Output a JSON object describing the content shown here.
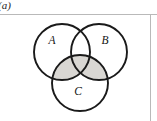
{
  "figure": {
    "caption": "(a)",
    "set_labels": {
      "a": "A",
      "b": "B",
      "c": "C"
    }
  },
  "chart_data": {
    "type": "diagram",
    "diagram_kind": "venn",
    "title": "(a)",
    "sets": [
      "A",
      "B",
      "C"
    ],
    "circles": [
      {
        "name": "A",
        "label": "A",
        "cx": 62,
        "cy": 52,
        "r": 28,
        "label_x": 52,
        "label_y": 44
      },
      {
        "name": "B",
        "label": "B",
        "cx": 99,
        "cy": 52,
        "r": 28,
        "label_x": 105,
        "label_y": 44
      },
      {
        "name": "C",
        "label": "C",
        "cx": 80,
        "cy": 83,
        "r": 28,
        "label_x": 78,
        "label_y": 95
      }
    ],
    "shaded_regions": [
      "A and C",
      "B and C",
      "A and B and C"
    ],
    "unshaded_regions": [
      "A only",
      "B only",
      "C only",
      "A and B only",
      "outside"
    ],
    "shaded_expression": "C ∩ (A ∪ B)",
    "colors": {
      "stroke": "#1a1a1a",
      "shade_fill": "#d9d7d3",
      "background": "#ffffff",
      "frame_rule": "#b9b9b9",
      "label_text": "#141414"
    },
    "stroke_width": 1.9,
    "legend": "none",
    "grid": false
  }
}
